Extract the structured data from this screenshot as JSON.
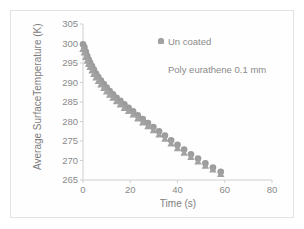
{
  "chart_data": {
    "type": "scatter",
    "title": "",
    "xlabel": "Time (s)",
    "ylabel": "Average SurfaceTemperature (K)",
    "xlim": [
      0,
      80
    ],
    "ylim": [
      265,
      305
    ],
    "xticks": [
      0,
      20,
      40,
      60,
      80
    ],
    "yticks": [
      265,
      270,
      275,
      280,
      285,
      290,
      295,
      300,
      305
    ],
    "grid": false,
    "legend_position": "top-right",
    "marker_color": "#9c9c9c",
    "series": [
      {
        "name": "Un coated",
        "marker": "circle",
        "color": "#9c9c9c",
        "x": [
          0.0,
          0.6,
          1.2,
          1.8,
          2.4,
          3.0,
          3.8,
          4.6,
          5.5,
          6.5,
          7.6,
          8.8,
          10.0,
          11.3,
          12.7,
          14.2,
          15.8,
          17.5,
          19.3,
          21.2,
          23.2,
          25.3,
          27.5,
          29.8,
          32.2,
          34.7,
          37.3,
          40.0,
          42.8,
          45.7,
          48.7,
          51.8,
          55.0,
          58.3
        ],
        "y": [
          299.8,
          299.0,
          297.9,
          296.8,
          295.9,
          295.1,
          294.2,
          293.3,
          292.3,
          291.4,
          290.5,
          289.6,
          288.7,
          287.8,
          287.0,
          286.1,
          285.3,
          284.4,
          283.5,
          282.6,
          281.6,
          280.6,
          279.6,
          278.6,
          277.5,
          276.4,
          275.2,
          274.0,
          272.8,
          271.6,
          270.5,
          269.3,
          268.2,
          267.1
        ]
      },
      {
        "name": "Poly eurathene 0.1 mm",
        "marker": "triangle",
        "color": "#a2a2a2",
        "x": [
          0.0,
          0.6,
          1.2,
          1.8,
          2.4,
          3.0,
          3.8,
          4.6,
          5.5,
          6.5,
          7.6,
          8.8,
          10.0,
          11.3,
          12.7,
          14.2,
          15.8,
          17.5,
          19.3,
          21.2,
          23.2,
          25.3,
          27.5,
          29.8,
          32.2,
          34.7,
          37.3,
          40.0,
          42.8,
          45.7,
          48.7,
          51.8,
          55.0,
          58.3
        ],
        "y": [
          298.6,
          297.7,
          296.6,
          295.6,
          294.8,
          294.0,
          293.1,
          292.2,
          291.3,
          290.4,
          289.5,
          288.6,
          287.7,
          286.9,
          286.1,
          285.2,
          284.4,
          283.5,
          282.7,
          281.8,
          280.8,
          279.8,
          278.8,
          277.8,
          276.7,
          275.6,
          274.4,
          273.2,
          272.0,
          270.9,
          269.8,
          268.7,
          267.7,
          266.6
        ]
      }
    ]
  },
  "legend": {
    "items": [
      {
        "label": "Un coated",
        "marker": "circle"
      },
      {
        "label": "Poly eurathene 0.1 mm",
        "marker": "triangle"
      }
    ]
  }
}
